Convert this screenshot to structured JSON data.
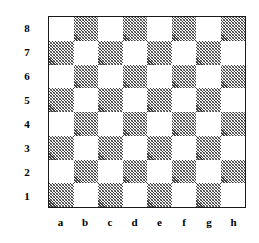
{
  "diagram": {
    "kind": "chessboard-coordinate-diagram",
    "colors": {
      "background": "#ffffff",
      "light_square": "#ffffff",
      "dark_square_hatch": "#3a3a3a",
      "border": "#1a1a1a",
      "label_text": "#000000"
    },
    "board": {
      "files": [
        "a",
        "b",
        "c",
        "d",
        "e",
        "f",
        "g",
        "h"
      ],
      "ranks": [
        "8",
        "7",
        "6",
        "5",
        "4",
        "3",
        "2",
        "1"
      ],
      "squares_per_side": 8,
      "top_left_square_shade": "light",
      "bottom_right_square_shade": "light",
      "shading": [
        [
          "light",
          "dark",
          "light",
          "dark",
          "light",
          "dark",
          "light",
          "dark"
        ],
        [
          "dark",
          "light",
          "dark",
          "light",
          "dark",
          "light",
          "dark",
          "light"
        ],
        [
          "light",
          "dark",
          "light",
          "dark",
          "light",
          "dark",
          "light",
          "dark"
        ],
        [
          "dark",
          "light",
          "dark",
          "light",
          "dark",
          "light",
          "dark",
          "light"
        ],
        [
          "light",
          "dark",
          "light",
          "dark",
          "light",
          "dark",
          "light",
          "dark"
        ],
        [
          "dark",
          "light",
          "dark",
          "light",
          "dark",
          "light",
          "dark",
          "light"
        ],
        [
          "light",
          "dark",
          "light",
          "dark",
          "light",
          "dark",
          "light",
          "dark"
        ],
        [
          "dark",
          "light",
          "dark",
          "light",
          "dark",
          "light",
          "dark",
          "light"
        ]
      ]
    }
  }
}
